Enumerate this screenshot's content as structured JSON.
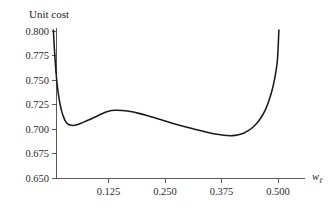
{
  "chart_data": {
    "type": "line",
    "title": "Unit cost",
    "xlabel": "w_ℓ",
    "xlabel_base": "w",
    "xlabel_sub": "ℓ",
    "ylabel": "Unit cost",
    "xlim": [
      0.0,
      0.5125
    ],
    "ylim": [
      0.65,
      0.8
    ],
    "grid": false,
    "legend": null,
    "xticks": [
      0.125,
      0.25,
      0.375,
      0.5
    ],
    "xtick_labels": [
      "0.125",
      "0.250",
      "0.375",
      "0.500"
    ],
    "yticks": [
      0.65,
      0.675,
      0.7,
      0.725,
      0.75,
      0.775,
      0.8
    ],
    "ytick_labels": [
      "0.650",
      "0.675",
      "0.700",
      "0.725",
      "0.750",
      "0.775",
      "0.800"
    ],
    "series": [
      {
        "name": "unit cost",
        "color": "#1a1a1a",
        "x": [
          0.003,
          0.0045,
          0.006,
          0.008,
          0.01,
          0.0125,
          0.015,
          0.018,
          0.0215,
          0.025,
          0.029,
          0.034,
          0.04,
          0.047,
          0.055,
          0.064,
          0.074,
          0.085,
          0.097,
          0.11,
          0.125,
          0.14,
          0.155,
          0.17,
          0.19,
          0.21,
          0.23,
          0.25,
          0.27,
          0.29,
          0.31,
          0.33,
          0.35,
          0.365,
          0.38,
          0.393,
          0.405,
          0.415,
          0.425,
          0.435,
          0.445,
          0.455,
          0.465,
          0.473,
          0.48,
          0.486,
          0.491,
          0.4955,
          0.499,
          0.502
        ],
        "y": [
          0.801,
          0.788,
          0.777,
          0.763,
          0.752,
          0.741,
          0.733,
          0.725,
          0.718,
          0.713,
          0.7085,
          0.7055,
          0.704,
          0.7036,
          0.7043,
          0.7058,
          0.7078,
          0.71,
          0.7125,
          0.7155,
          0.7182,
          0.7191,
          0.7189,
          0.718,
          0.7162,
          0.7138,
          0.711,
          0.7082,
          0.7054,
          0.7028,
          0.7004,
          0.6981,
          0.696,
          0.6947,
          0.6937,
          0.6932,
          0.6935,
          0.6944,
          0.696,
          0.6985,
          0.702,
          0.7068,
          0.7135,
          0.7205,
          0.729,
          0.738,
          0.7475,
          0.759,
          0.772,
          0.801
        ]
      }
    ],
    "annotations": []
  },
  "figure": {
    "title": "Unit cost",
    "x_axis_name_base": "w",
    "x_axis_name_sub": "ℓ"
  }
}
